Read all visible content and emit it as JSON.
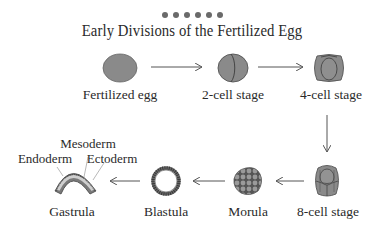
{
  "header": {
    "dots_count": 6,
    "title": "Early Divisions of the Fertilized Egg"
  },
  "stages": [
    {
      "id": "fertilized-egg",
      "label": "Fertilized egg"
    },
    {
      "id": "2-cell",
      "label": "2-cell stage"
    },
    {
      "id": "4-cell",
      "label": "4-cell stage"
    },
    {
      "id": "8-cell",
      "label": "8-cell stage"
    },
    {
      "id": "morula",
      "label": "Morula"
    },
    {
      "id": "blastula",
      "label": "Blastula"
    },
    {
      "id": "gastrula",
      "label": "Gastrula"
    }
  ],
  "gastrula_layers": {
    "mesoderm": "Mesoderm",
    "endoderm": "Endoderm",
    "ectoderm": "Ectoderm"
  },
  "colors": {
    "cell_fill": "#8a8a8a",
    "cell_stroke": "#555555",
    "arrow": "#555555",
    "text": "#2a2a2a"
  }
}
